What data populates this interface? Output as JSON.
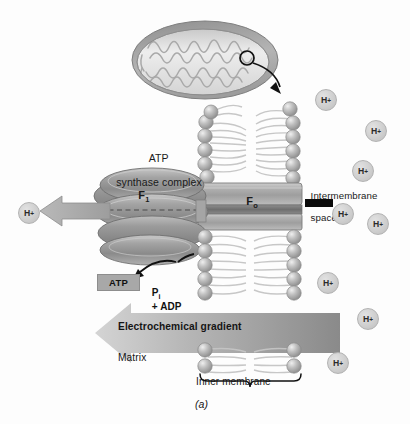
{
  "figure": {
    "caption": "(a)"
  },
  "labels": {
    "atp_synthase_complex": "ATP\nsynthase complex",
    "atp_synthase_line1": "ATP",
    "atp_synthase_line2": "synthase complex",
    "f1_subunit": "F",
    "f1_subscript": "1",
    "f0_subunit": "F",
    "f0_subscript": "o",
    "intermembrane_space": "Intermembrane\nspace",
    "intermembrane_line1": "Intermembrane",
    "intermembrane_line2": "space",
    "atp_product": "ATP",
    "substrate_p": "P",
    "substrate_p_subscript": "i",
    "substrate_rest": "+ ADP",
    "electrochemical_gradient": "Electrochemical gradient",
    "matrix": "Matrix",
    "inner_membrane": "Inner membrane"
  },
  "proton_ions": {
    "symbol": "H",
    "charge": "+",
    "count_right": 9,
    "count_left": 1,
    "positions_right": [
      {
        "x": 315,
        "y": 89
      },
      {
        "x": 365,
        "y": 120
      },
      {
        "x": 352,
        "y": 160
      },
      {
        "x": 332,
        "y": 203
      },
      {
        "x": 367,
        "y": 213
      },
      {
        "x": 317,
        "y": 272
      },
      {
        "x": 357,
        "y": 308
      },
      {
        "x": 327,
        "y": 352
      }
    ],
    "positions_left": [
      {
        "x": 18,
        "y": 202
      }
    ]
  },
  "colors": {
    "background": "#fdfdfd",
    "membrane_head": "#b6b6b6",
    "membrane_tail": "#d6d6d6",
    "complex_fill": "#9a9a9a",
    "complex_light": "#c3c3c3",
    "gradient_arrow_light": "#cfcfcf",
    "gradient_arrow_dark": "#8e8e8e",
    "atp_box": "#a8a8a8",
    "proton_circle": "#cfcfcf",
    "text": "#1a1a1a",
    "outline": "#6e6e6e",
    "leader_black": "#0b0b0b"
  },
  "icons": {
    "mitochondrion": "mitochondrion-icon",
    "zoom_callout": "zoom-callout-circle-icon",
    "callout_arrow": "curved-arrow-icon",
    "proton_arrow": "left-arrow-icon",
    "atp_arrow": "curved-reaction-arrow-icon",
    "gradient_arrow": "left-block-arrow-icon",
    "brace": "curly-brace-icon"
  }
}
